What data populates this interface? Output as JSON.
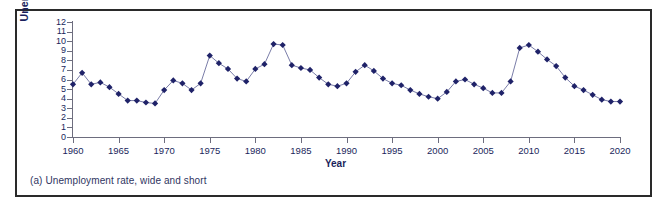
{
  "figure": {
    "caption": "(a) Unemployment rate, wide and short",
    "frame_color": "#2a2a2a",
    "background": "#ffffff"
  },
  "chart_data": {
    "type": "line",
    "title": "",
    "subtitle": "",
    "xlabel": "Year",
    "ylabel": "Unemployment Rate (%)",
    "xlim": [
      1960,
      2020
    ],
    "ylim": [
      0,
      12
    ],
    "xticks": [
      1960,
      1965,
      1970,
      1975,
      1980,
      1985,
      1990,
      1995,
      2000,
      2005,
      2010,
      2015,
      2020
    ],
    "xtick_labels": [
      "1960",
      "1965",
      "1970",
      "1975",
      "1980",
      "1985",
      "1990",
      "1995",
      "2000",
      "2005",
      "2010",
      "2015",
      "2020"
    ],
    "yticks": [
      0,
      1,
      2,
      3,
      4,
      5,
      6,
      7,
      8,
      9,
      10,
      11,
      12
    ],
    "ytick_labels": [
      "0",
      "1",
      "2",
      "3",
      "4",
      "5",
      "6",
      "7",
      "8",
      "9",
      "10",
      "11",
      "12"
    ],
    "grid": false,
    "legend": null,
    "legend_position": "none",
    "marker": "diamond",
    "marker_color": "#1f2268",
    "line_color": "#6b6e9e",
    "series": [
      {
        "name": "Unemployment rate",
        "x": [
          1960,
          1961,
          1962,
          1963,
          1964,
          1965,
          1966,
          1967,
          1968,
          1969,
          1970,
          1971,
          1972,
          1973,
          1974,
          1975,
          1976,
          1977,
          1978,
          1979,
          1980,
          1981,
          1982,
          1983,
          1984,
          1985,
          1986,
          1987,
          1988,
          1989,
          1990,
          1991,
          1992,
          1993,
          1994,
          1995,
          1996,
          1997,
          1998,
          1999,
          2000,
          2001,
          2002,
          2003,
          2004,
          2005,
          2006,
          2007,
          2008,
          2009,
          2010,
          2011,
          2012,
          2013,
          2014,
          2015,
          2016,
          2017,
          2018,
          2019,
          2020
        ],
        "values": [
          5.5,
          6.7,
          5.5,
          5.7,
          5.2,
          4.5,
          3.8,
          3.8,
          3.6,
          3.5,
          4.9,
          5.9,
          5.6,
          4.9,
          5.6,
          8.5,
          7.7,
          7.1,
          6.1,
          5.8,
          7.1,
          7.6,
          9.7,
          9.6,
          7.5,
          7.2,
          7.0,
          6.2,
          5.5,
          5.3,
          5.6,
          6.8,
          7.5,
          6.9,
          6.1,
          5.6,
          5.4,
          4.9,
          4.5,
          4.2,
          4.0,
          4.7,
          5.8,
          6.0,
          5.5,
          5.1,
          4.6,
          4.6,
          5.8,
          9.3,
          9.6,
          8.9,
          8.1,
          7.4,
          6.2,
          5.3,
          4.9,
          4.4,
          3.9,
          3.7,
          3.7
        ]
      }
    ]
  }
}
